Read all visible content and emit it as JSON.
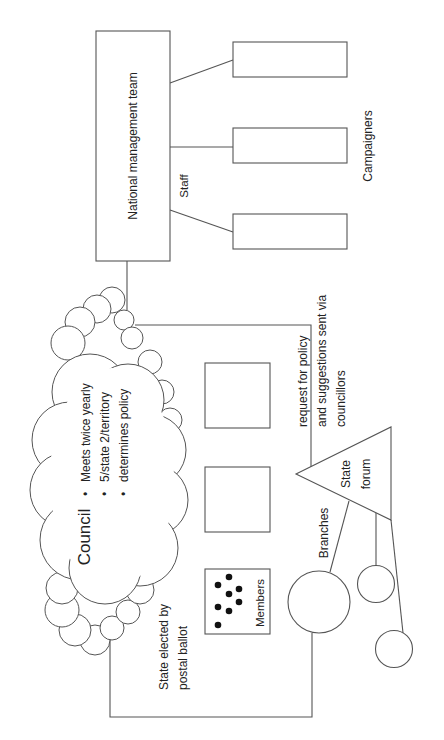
{
  "diagram": {
    "orientation": "rotated -90deg (text reads bottom-to-top)",
    "national_management": {
      "label": "National management team"
    },
    "staff": {
      "label": "Staff",
      "boxes": 3
    },
    "campaigners": {
      "label": "Campaigners"
    },
    "council": {
      "title": "Council",
      "bullets": [
        "Meets twice yearly",
        "5/state 2/territory",
        "determines policy"
      ],
      "bullet_glyph": "•"
    },
    "policy_flow": {
      "line1": "request for policy",
      "line2": "and suggestions sent via",
      "line3": "councillors"
    },
    "election": {
      "line1": "State elected by",
      "line2": "postal ballot"
    },
    "members": {
      "label": "Members",
      "dot_count": 8
    },
    "state_forum": {
      "line1": "State",
      "line2": "forum"
    },
    "branches": {
      "label": "Branches",
      "circles": 3
    },
    "colors": {
      "stroke": "#555555",
      "text": "#222222",
      "dots": "#111111",
      "background": "#ffffff"
    }
  }
}
